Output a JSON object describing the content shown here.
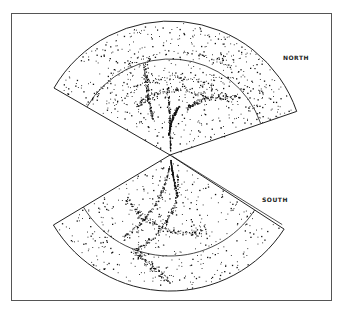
{
  "figure": {
    "labels": {
      "north": "NORTH",
      "south": "SOUTH"
    },
    "wedges": [
      {
        "name": "north",
        "direction": "up",
        "point_density": "dense filaments and voids"
      },
      {
        "name": "south",
        "direction": "down",
        "point_density": "dense diagonal wall"
      }
    ],
    "colors": {
      "ink": "#111111",
      "frame": "#555555",
      "background": "#ffffff"
    }
  }
}
